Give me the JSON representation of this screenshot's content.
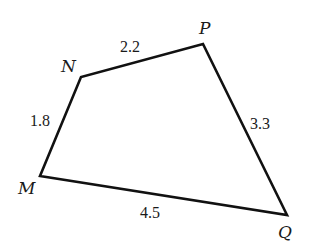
{
  "figure": {
    "type": "quadrilateral",
    "stroke_color": "#111111",
    "background": "#ffffff",
    "vertices": [
      {
        "name": "M",
        "x": 40,
        "y": 176,
        "label_x": 18,
        "label_y": 194
      },
      {
        "name": "N",
        "x": 81,
        "y": 77,
        "label_x": 61,
        "label_y": 72
      },
      {
        "name": "P",
        "x": 203,
        "y": 44,
        "label_x": 199,
        "label_y": 34
      },
      {
        "name": "Q",
        "x": 287,
        "y": 215,
        "label_x": 278,
        "label_y": 238
      }
    ],
    "edges": [
      {
        "from": "M",
        "to": "N",
        "length": "1.8",
        "label_x": 30,
        "label_y": 126
      },
      {
        "from": "N",
        "to": "P",
        "length": "2.2",
        "label_x": 120,
        "label_y": 52
      },
      {
        "from": "P",
        "to": "Q",
        "length": "3.3",
        "label_x": 250,
        "label_y": 129
      },
      {
        "from": "Q",
        "to": "M",
        "length": "4.5",
        "label_x": 140,
        "label_y": 218
      }
    ]
  }
}
